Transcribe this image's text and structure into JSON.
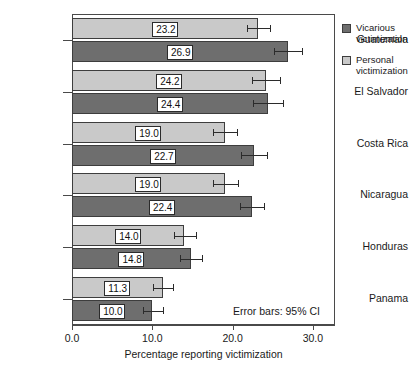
{
  "chart_data": {
    "type": "bar",
    "orientation": "horizontal",
    "title": "",
    "xlabel": "Percentage reporting victimization",
    "ylabel": "",
    "xlim": [
      0.0,
      32.7
    ],
    "xticks": [
      "0.0",
      "10.0",
      "20.0",
      "30.0"
    ],
    "xtick_values": [
      0.0,
      10.0,
      20.0,
      30.0
    ],
    "grid": false,
    "legend_position": "right",
    "annotation": "Error bars: 95% CI",
    "categories": [
      "Guatemala",
      "El Salvador",
      "Costa Rica",
      "Nicaragua",
      "Honduras",
      "Panama"
    ],
    "series": [
      {
        "name": "Personal victimization",
        "color": "#c9c9c9",
        "values": [
          23.2,
          24.2,
          19.0,
          19.0,
          14.0,
          11.3
        ],
        "labels": [
          "23.2",
          "24.2",
          "19.0",
          "19.0",
          "14.0",
          "11.3"
        ],
        "ci_low": [
          21.8,
          22.4,
          17.6,
          17.5,
          12.7,
          10.1
        ],
        "ci_high": [
          24.7,
          25.9,
          20.6,
          20.7,
          15.4,
          12.6
        ]
      },
      {
        "name": "Vicarious victimization",
        "color": "#6e6e6e",
        "values": [
          26.9,
          24.4,
          22.7,
          22.4,
          14.8,
          10.0
        ],
        "labels": [
          "26.9",
          "24.4",
          "22.7",
          "22.4",
          "14.8",
          "10.0"
        ],
        "ci_low": [
          25.2,
          22.6,
          21.1,
          20.9,
          13.4,
          8.8
        ],
        "ci_high": [
          28.6,
          26.3,
          24.3,
          23.9,
          16.2,
          11.3
        ]
      }
    ]
  },
  "legend": {
    "items": [
      {
        "line1": "Vicarious",
        "line2": "victimization",
        "color": "#6e6e6e"
      },
      {
        "line1": "Personal",
        "line2": "victimization",
        "color": "#c9c9c9"
      }
    ]
  },
  "axis": {
    "x_title": "Percentage reporting victimization",
    "ticks": [
      "0.0",
      "10.0",
      "20.0",
      "30.0"
    ]
  },
  "annotation": {
    "text": "Error bars: 95% CI"
  }
}
